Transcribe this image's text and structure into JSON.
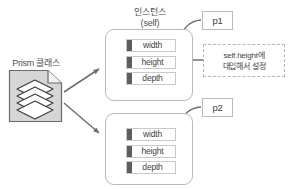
{
  "diagram": {
    "title_text": "인스턴스 (self)",
    "class_node": {
      "label": "Prism 클래스",
      "icon": "stacked-prism-document-icon"
    },
    "instance_title": {
      "line1": "인스턴스",
      "line2": "(self)"
    },
    "instances": [
      {
        "tag": "p1",
        "properties": [
          {
            "name": "width"
          },
          {
            "name": "height"
          },
          {
            "name": "depth"
          }
        ],
        "caption": "속성"
      },
      {
        "tag": "p2",
        "properties": [
          {
            "name": "width"
          },
          {
            "name": "height"
          },
          {
            "name": "depth"
          }
        ],
        "caption": ""
      }
    ],
    "callout": {
      "line1": "self.height에",
      "line2": "대입해서 설정",
      "points_to": "height"
    },
    "colors": {
      "stroke": "#b9b9b9",
      "bar": "#5d5d5d",
      "arrow": "#6e6e6e",
      "text": "#444444",
      "icon_fill": "#d4d4d4",
      "background": "#ffffff"
    }
  }
}
